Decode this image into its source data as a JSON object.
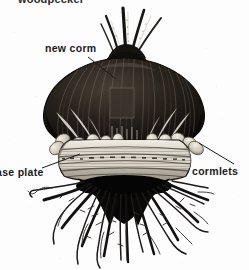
{
  "figure": {
    "subject": "corm",
    "style": "black and white scanned line engraving",
    "background_color": "#fdfdfd",
    "ink_color": "#1a1a1a",
    "width_px": 249,
    "height_px": 270
  },
  "clipped_caption": {
    "text": "woodpecker",
    "note": "caption at very top of image, cropped so only the bottom few pixels of the letters are visible"
  },
  "labels": [
    {
      "id": "new-corm",
      "text": "new corm",
      "position": "upper-left",
      "leader_from": [
        107,
        58
      ],
      "leader_to": [
        134,
        78
      ]
    },
    {
      "id": "base-plate",
      "text": "ase plate",
      "full_text": "base plate",
      "position": "lower-left",
      "note": "initial letter b is cut off by the left edge of the image",
      "leader_from": [
        44,
        166
      ],
      "leader_to": [
        78,
        155
      ]
    },
    {
      "id": "cormlets",
      "text": "cormlets",
      "position": "lower-right",
      "leader_from": [
        232,
        163
      ],
      "leader_to": [
        196,
        141
      ]
    }
  ],
  "parts": [
    {
      "name": "shoots",
      "description": "slender leaf shoots emerging from the top of the corm"
    },
    {
      "name": "new corm",
      "description": "large dark rounded corm body with vertical fibrous striations"
    },
    {
      "name": "cormlets",
      "description": "small pale oval offsets clustered around the base of the corm"
    },
    {
      "name": "base plate",
      "description": "pale horizontal banded plate beneath the corm body"
    },
    {
      "name": "roots",
      "description": "dense black root mass with long spreading fibrous roots"
    }
  ],
  "colors": {
    "paper": "#fdfdfd",
    "ink": "#1a1a1a",
    "deep_shadow": "#0d0d0d",
    "mid_tone": "#5a5550",
    "highlight": "#e8e4dc",
    "cormlet_fill": "#d9d4c9",
    "base_plate_fill": "#d6d1c6"
  }
}
